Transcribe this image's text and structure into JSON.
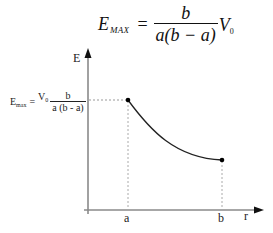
{
  "formula_top": {
    "lhs": "E",
    "lhs_subscript": "MAX",
    "equals": "=",
    "numerator": "b",
    "denominator": "a(b − a)",
    "factor": "V",
    "factor_subscript": "0"
  },
  "emax_label": {
    "lhs": "E",
    "lhs_subscript": "max",
    "equals": "=",
    "factor": "V",
    "factor_subscript": "0",
    "numerator": "b",
    "denominator": "a (b - a)"
  },
  "axes": {
    "y_label": "E",
    "x_label": "r",
    "x_ticks": [
      "a",
      "b"
    ]
  },
  "curve": {
    "description": "E decreases hyperbolically from E_max at r=a to a lower value at r=b",
    "start_point": {
      "r": "a",
      "E": "E_max"
    },
    "end_point": {
      "r": "b",
      "E": "E(b)"
    },
    "colors": {
      "curve": "#222222",
      "axes": "#888888",
      "guides": "#999999"
    }
  }
}
